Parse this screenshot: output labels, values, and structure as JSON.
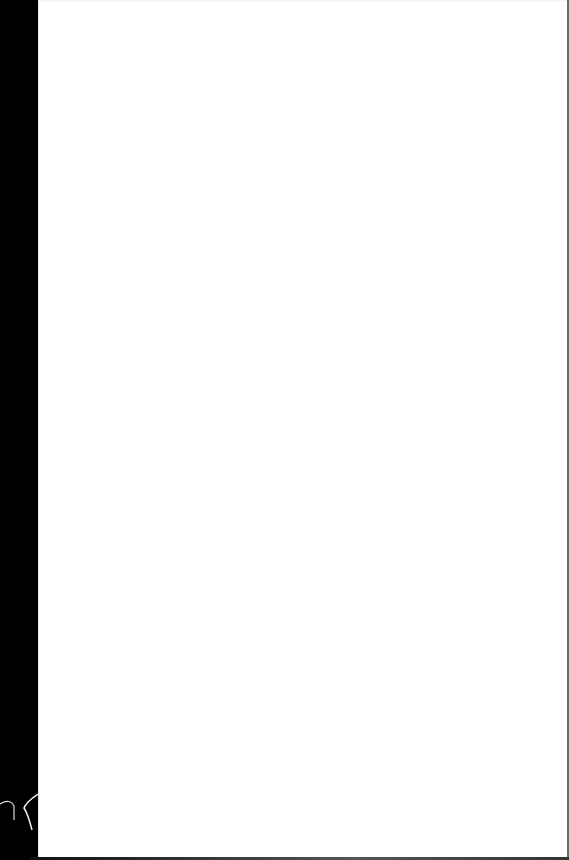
{
  "document": {
    "type": "scanned-page",
    "content": "",
    "colors": {
      "page": "#ffffff",
      "background": "#000000",
      "edge": "#6a6a6a"
    }
  }
}
